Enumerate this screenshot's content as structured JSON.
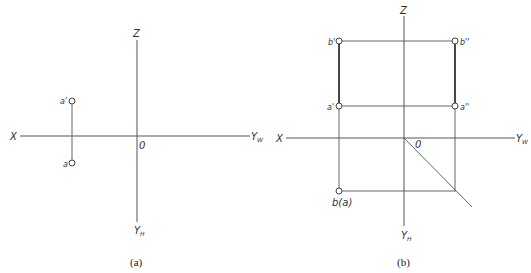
{
  "figure_a": {
    "caption": "(a)",
    "axes": {
      "x_label": "X",
      "z_label": "Z",
      "yw_label": "Y",
      "yw_sub": "W",
      "yh_label": "Y",
      "yh_sub": "H",
      "origin_label": "0"
    },
    "points": [
      {
        "label": "a'",
        "view": "front"
      },
      {
        "label": "a",
        "view": "top"
      }
    ]
  },
  "figure_b": {
    "caption": "(b)",
    "axes": {
      "x_label": "X",
      "z_label": "Z",
      "yw_label": "Y",
      "yw_sub": "W",
      "yh_label": "Y",
      "yh_sub": "H",
      "origin_label": "0"
    },
    "points": [
      {
        "label": "b'",
        "view": "front"
      },
      {
        "label": "a'",
        "view": "front"
      },
      {
        "label": "b''",
        "view": "side"
      },
      {
        "label": "a''",
        "view": "side"
      },
      {
        "label": "b(a)",
        "view": "top"
      }
    ]
  },
  "colors": {
    "line": "#555555",
    "bold_line": "#333333",
    "text": "#333333",
    "background": "#ffffff"
  }
}
